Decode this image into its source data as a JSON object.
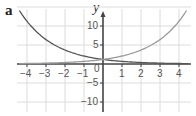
{
  "panel_label": "a",
  "chart_data": {
    "type": "line",
    "title": "",
    "xlabel": "",
    "ylabel": "y",
    "xlim": [
      -4.5,
      4.5
    ],
    "ylim": [
      -12,
      15
    ],
    "grid": true,
    "x_ticks": [
      -4,
      -3,
      -2,
      -1,
      1,
      2,
      3,
      4
    ],
    "y_ticks": [
      10,
      5,
      -5,
      -10
    ],
    "origin_label": "0",
    "series": [
      {
        "name": "decreasing exponential",
        "color": "#555555",
        "x": [
          -4.4,
          -4,
          -3,
          -2,
          -1,
          0,
          1,
          2,
          3,
          4,
          4.5
        ],
        "y": [
          14.0,
          11.3,
          6.4,
          3.7,
          2.1,
          1.2,
          0.7,
          0.4,
          0.2,
          0.13,
          0.1
        ]
      },
      {
        "name": "increasing exponential",
        "color": "#999999",
        "x": [
          -4.4,
          -4,
          -3,
          -2,
          -1,
          0,
          1,
          2,
          3,
          4,
          4.5
        ],
        "y": [
          0.1,
          0.13,
          0.2,
          0.4,
          0.7,
          1.2,
          2.1,
          3.7,
          6.4,
          11.3,
          14.0
        ]
      }
    ]
  }
}
